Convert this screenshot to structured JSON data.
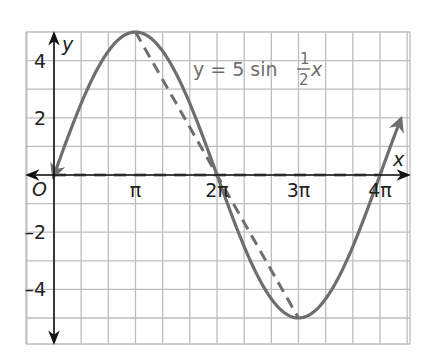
{
  "chart_data": {
    "type": "line",
    "title": "",
    "equation": {
      "prefix": "y = 5 sin ",
      "frac_num": "1",
      "frac_den": "2",
      "suffix": "x"
    },
    "xlabel": "x",
    "ylabel": "y",
    "origin_label": "O",
    "x_unit": "pi",
    "xlim": [
      -1.0,
      4.3
    ],
    "ylim": [
      -5.9,
      5.0
    ],
    "grid": true,
    "x_grid_step_pi": 0.3333,
    "y_grid_step": 1,
    "x_ticks": [
      {
        "value_pi": 1,
        "label": "π"
      },
      {
        "value_pi": 2,
        "label": "2π"
      },
      {
        "value_pi": 3,
        "label": "3π"
      },
      {
        "value_pi": 4,
        "label": "4π"
      }
    ],
    "y_ticks": [
      {
        "value": 4,
        "label": "4"
      },
      {
        "value": 2,
        "label": "2"
      },
      {
        "value": -2,
        "label": "–2"
      },
      {
        "value": -4,
        "label": "–4"
      }
    ],
    "series": [
      {
        "name": "y = 5 sin (1/2)x",
        "style": "solid",
        "color": "#6e6e6e",
        "function": "5*sin(x/2)",
        "x_range_pi": [
          0,
          4.25
        ],
        "endpoints": "arrows"
      },
      {
        "name": "dashed guide",
        "style": "dashed",
        "color": "#6e6e6e",
        "points": [
          {
            "x_pi": 1,
            "y": 5
          },
          {
            "x_pi": 3,
            "y": -5
          }
        ]
      },
      {
        "name": "dashed midline",
        "style": "dashed",
        "color": "#777777",
        "points": [
          {
            "x_pi": 0,
            "y": 0
          },
          {
            "x_pi": 4,
            "y": 0
          }
        ]
      }
    ],
    "key_points": [
      {
        "x_pi": 0,
        "y": 0
      },
      {
        "x_pi": 1,
        "y": 5
      },
      {
        "x_pi": 2,
        "y": 0
      },
      {
        "x_pi": 3,
        "y": -5
      },
      {
        "x_pi": 4,
        "y": 0
      }
    ]
  }
}
